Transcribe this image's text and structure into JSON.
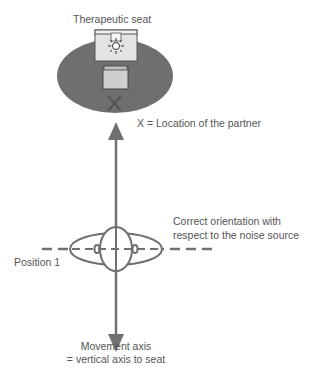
{
  "title": "Therapeutic seat",
  "partner_label": "X = Location of the partner",
  "partner_marker": "X",
  "orientation_label_line1": "Correct orientation with",
  "orientation_label_line2": "respect to the noise source",
  "position_label": "Position 1",
  "axis_label_line1": "Movement axis",
  "axis_label_line2": "= vertical axis to seat",
  "icons": {
    "seat": "seat-icon",
    "lamp": "lamp-sun-icon",
    "head": "head-top-view-icon"
  },
  "colors": {
    "ellipse_fill": "#6f6f6f",
    "line": "#707070",
    "text": "#555555",
    "seat_fill": "#d8d8d8"
  }
}
